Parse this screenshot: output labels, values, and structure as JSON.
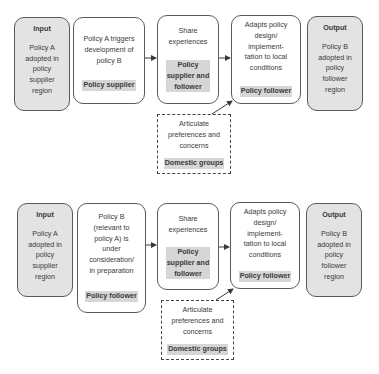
{
  "top": {
    "input": {
      "title": "Input",
      "text": "Policy A\nadopted in\npolicy\nsupplier\nregion"
    },
    "step1": {
      "text": "Policy A triggers\ndevelopment of\npolicy B",
      "role": "Policy supplier"
    },
    "step2": {
      "text": "Share\nexperiences",
      "role": "Policy\nsupplier and\nfollower"
    },
    "step3": {
      "text": "Adapts policy\ndesign/\nimplement-\ntation to local\nconditions",
      "role": "Policy follower"
    },
    "output": {
      "title": "Output",
      "text": "Policy B\nadopted in\npolicy\nfollower\nregion"
    },
    "domestic": {
      "text": "Articulate\npreferences and\nconcerns",
      "role": "Domestic groups"
    }
  },
  "bottom": {
    "input": {
      "title": "Input",
      "text": "Policy A\nadopted in\npolicy\nsupplier\nregion"
    },
    "step1": {
      "text": "Policy B\n(relevant to\npolicy A) is\nunder\nconsideration/\nin preparation",
      "role": "Policy follower"
    },
    "step2": {
      "text": "Share\nexperiences",
      "role": "Policy\nsupplier and\nfollower"
    },
    "step3": {
      "text": "Adapts policy\ndesign/\nimplement-\ntation to local\nconditions",
      "role": "Policy follower"
    },
    "output": {
      "title": "Output",
      "text": "Policy B\nadopted in\npolicy\nfollower\nregion"
    },
    "domestic": {
      "text": "Articulate\npreferences and\nconcerns",
      "role": "Domestic groups"
    }
  },
  "colors": {
    "gray_fill": "#e3e3e3",
    "role_highlight": "#d6d6d6",
    "border": "#5a5a5a"
  }
}
